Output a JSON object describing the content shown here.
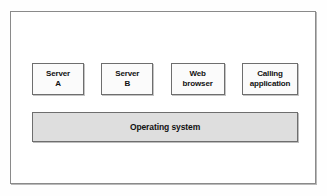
{
  "diagram": {
    "frame": {
      "border_color": "#8a8a8a",
      "background_color": "#ffffff"
    },
    "components": [
      {
        "name": "server-a",
        "lines": [
          "Server",
          "A"
        ],
        "fill_color": "#fbfbfb",
        "border_color": "#6e6e6e"
      },
      {
        "name": "server-b",
        "lines": [
          "Server",
          "B"
        ],
        "fill_color": "#fbfbfb",
        "border_color": "#6e6e6e"
      },
      {
        "name": "web-browser",
        "lines": [
          "Web",
          "browser"
        ],
        "fill_color": "#fbfbfb",
        "border_color": "#6e6e6e"
      },
      {
        "name": "calling-application",
        "lines": [
          "Calling",
          "application"
        ],
        "fill_color": "#fbfbfb",
        "border_color": "#6e6e6e"
      }
    ],
    "platform": {
      "name": "operating-system",
      "label": "Operating system",
      "fill_color": "#dedede",
      "border_color": "#6e6e6e"
    }
  }
}
